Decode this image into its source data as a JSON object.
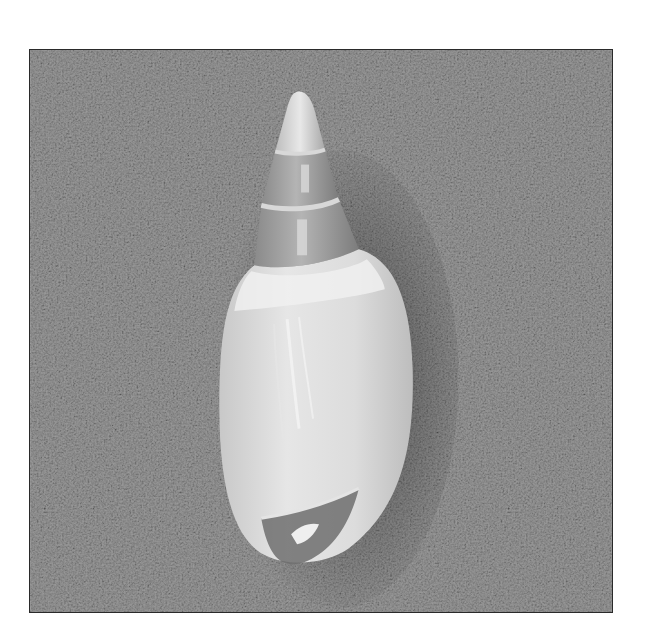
{
  "image": {
    "subject": "seashell",
    "description": "Grayscale photograph of an elongated spiral seashell (volute) resting on a fine-grained sandy textured background, framed by a thin dark border",
    "colors": {
      "page_background": "#ffffff",
      "frame_border": "#2a2a2a",
      "background_texture": "#8c8c8c",
      "shell_body": "#d6d6d6",
      "shell_highlight": "#eeeeee",
      "spire_band": "#9a9a9a",
      "aperture_shadow": "#6e6e6e"
    }
  }
}
